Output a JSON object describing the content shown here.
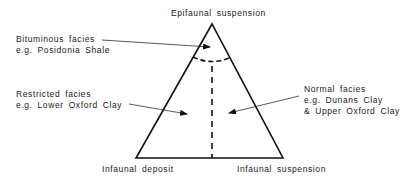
{
  "diagram": {
    "vertices": {
      "top": "Epifaunal suspension",
      "bottom_left": "Infaunal deposit",
      "bottom_right": "Infaunal suspension"
    },
    "annotations": [
      {
        "title": "Bituminous facies",
        "example": "e.g. Posidonia Shale"
      },
      {
        "title": "Restricted facies",
        "example": "e.g. Lower Oxford Clay"
      },
      {
        "title": "Normal facies",
        "example": "e.g. Dunans Clay",
        "example2": "& Upper Oxford Clay"
      }
    ],
    "colors": {
      "line": "#111111",
      "background": "#ffffff"
    }
  }
}
